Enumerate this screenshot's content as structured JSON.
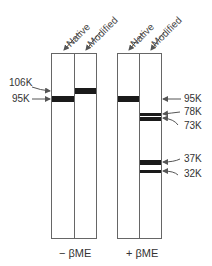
{
  "gels": [
    {
      "condition": "− βME",
      "lanes": [
        {
          "label": "Native",
          "bands": [
            "95K"
          ]
        },
        {
          "label": "Modified",
          "bands": [
            "106K"
          ]
        }
      ]
    },
    {
      "condition": "+ βME",
      "lanes": [
        {
          "label": "Native",
          "bands": [
            "95K"
          ]
        },
        {
          "label": "Modified",
          "bands": [
            "78K",
            "73K",
            "37K",
            "32K"
          ]
        }
      ]
    }
  ],
  "left_markers": {
    "m106": "106K",
    "m95": "95K"
  },
  "right_markers": {
    "m95": "95K",
    "m78": "78K",
    "m73": "73K",
    "m37": "37K",
    "m32": "32K"
  },
  "colors": {
    "band": "#1a1a1a",
    "outline": "#666666",
    "arrow": "#555555"
  }
}
